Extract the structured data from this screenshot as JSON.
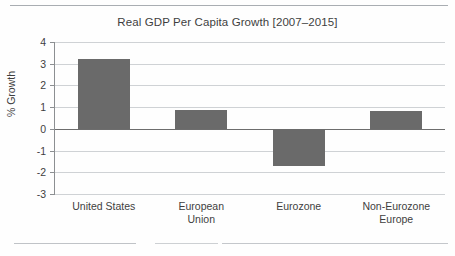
{
  "chart_data": {
    "type": "bar",
    "title": "Real GDP Per Capita Growth [2007–2015]",
    "xlabel": "",
    "ylabel": "% Growth",
    "categories": [
      "United States",
      "European Union",
      "Eurozone",
      "Non-Eurozone Europe"
    ],
    "category_lines": [
      [
        "United States"
      ],
      [
        "European",
        "Union"
      ],
      [
        "Eurozone"
      ],
      [
        "Non-Eurozone",
        "Europe"
      ]
    ],
    "values": [
      3.2,
      0.85,
      -1.7,
      0.8
    ],
    "ylim": [
      -3,
      4
    ],
    "yticks": [
      4,
      3,
      2,
      1,
      0,
      -1,
      -2,
      -3
    ],
    "ytick_labels": [
      "4",
      "3",
      "2",
      "1",
      "0",
      "-1",
      "-2",
      "-3"
    ],
    "grid": true,
    "legend": "none",
    "bar_color": "#6a6a6a",
    "gridline_color": "#cfd2d5",
    "axis_color": "#8c8f92",
    "zero_line_color": "#6d6d6d",
    "text_color": "#3e3e3e"
  }
}
